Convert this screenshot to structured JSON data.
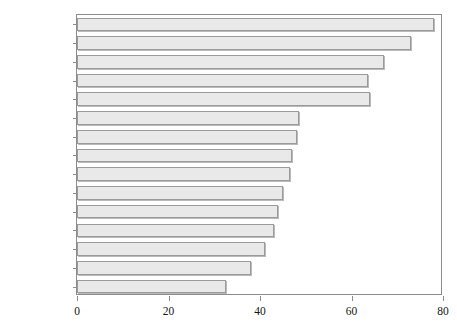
{
  "chart_data": {
    "type": "bar",
    "orientation": "horizontal",
    "title": "",
    "title_note": "title is cropped off the top edge of the screenshot and is not legible",
    "xlabel": "",
    "ylabel": "",
    "xlim": [
      0,
      80
    ],
    "xticks": [
      0,
      20,
      40,
      60,
      80
    ],
    "xtick_labels": [
      "0",
      "20",
      "40",
      "60",
      "80"
    ],
    "grid": false,
    "legend": false,
    "bar_color": "#e9e9e9",
    "bar_edge_color": "#9a9a9a",
    "axis_color": "#8c8c8c",
    "categories": [
      "India",
      "China",
      "Mexico",
      "Canada",
      "United States",
      "Australia",
      "Nigeria",
      "Brazil",
      "Italy",
      "Japan",
      "South Africa",
      "Argentina",
      "Germany",
      "U.K.",
      "France"
    ],
    "values": [
      78,
      73,
      67,
      63.5,
      64,
      48.5,
      48,
      47,
      46.5,
      45,
      44,
      43,
      41,
      38,
      32.5
    ]
  }
}
